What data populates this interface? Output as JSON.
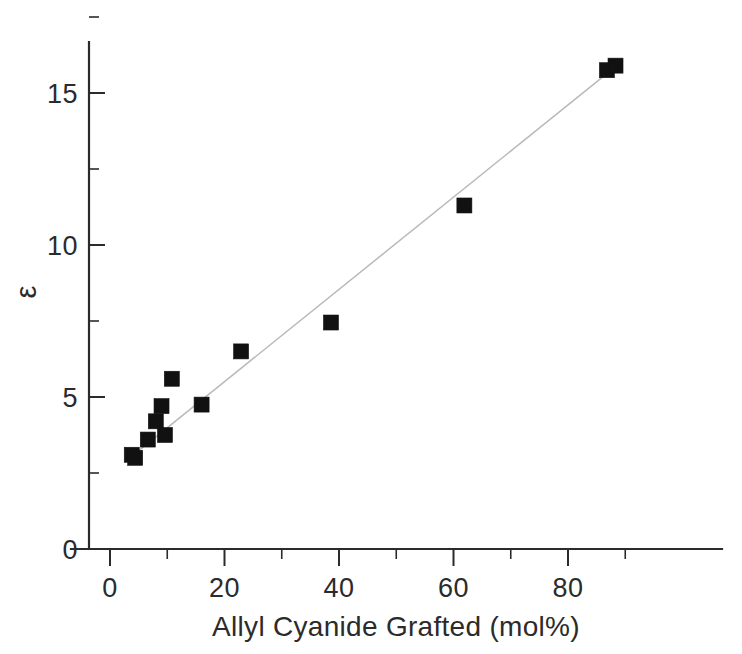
{
  "chart_data": {
    "type": "scatter",
    "title": "",
    "xlabel": "Allyl Cyanide Grafted (mol%)",
    "ylabel": "ε",
    "xlim": [
      -5,
      107
    ],
    "ylim": [
      -0.6,
      18.0
    ],
    "grid": false,
    "legend": null,
    "x_ticks_major": [
      0,
      20,
      40,
      60,
      80
    ],
    "x_ticks_minor": [
      10,
      30,
      50,
      70,
      90
    ],
    "x_ticklabels": [
      "0",
      "20",
      "40",
      "60",
      "80"
    ],
    "y_ticks_major": [
      0,
      5,
      10,
      15
    ],
    "y_ticks_minor": [
      2.5,
      7.5,
      12.5,
      17.5
    ],
    "y_ticklabels": [
      "0",
      "5",
      "10",
      "15"
    ],
    "series": [
      {
        "name": "measured",
        "marker": "filled-square",
        "color": "#111111",
        "points": [
          {
            "x": 3.8,
            "y": 3.1
          },
          {
            "x": 4.4,
            "y": 3.0
          },
          {
            "x": 6.6,
            "y": 3.6
          },
          {
            "x": 8.0,
            "y": 4.2
          },
          {
            "x": 9.0,
            "y": 4.7
          },
          {
            "x": 9.6,
            "y": 3.75
          },
          {
            "x": 10.8,
            "y": 5.6
          },
          {
            "x": 16.0,
            "y": 4.75
          },
          {
            "x": 22.9,
            "y": 6.5
          },
          {
            "x": 38.6,
            "y": 7.45
          },
          {
            "x": 61.9,
            "y": 11.3
          },
          {
            "x": 86.8,
            "y": 15.75
          },
          {
            "x": 88.3,
            "y": 15.9
          }
        ]
      },
      {
        "name": "linear-fit",
        "type": "line",
        "color": "#b9b9b9",
        "endpoints": [
          {
            "x": 2.5,
            "y": 2.85
          },
          {
            "x": 89.5,
            "y": 16.05
          }
        ]
      }
    ]
  },
  "axes": {
    "x_title": "Allyl Cyanide Grafted (mol%)",
    "y_title": "ε"
  }
}
